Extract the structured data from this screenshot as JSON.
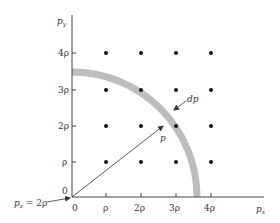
{
  "diagram": {
    "axes": {
      "x_label": "p",
      "x_label_sub": "x",
      "y_label": "p",
      "y_label_sub": "y",
      "origin_x_label": "0",
      "origin_y_label": "0",
      "x_ticks": [
        "ρ",
        "2ρ",
        "3ρ",
        "4ρ"
      ],
      "y_ticks": [
        "ρ",
        "2ρ",
        "3ρ",
        "4ρ"
      ]
    },
    "annotations": {
      "pz_label": "p",
      "pz_sub": "z",
      "pz_value": " = 2ρ",
      "radius_label": "p",
      "shell_label": "dp"
    },
    "grid": {
      "rows": 4,
      "cols": 4,
      "dot_color": "#111111"
    },
    "shell": {
      "color": "#bdbdbd",
      "radius_in_rho": 3.6
    },
    "colors": {
      "axis": "#444444",
      "arrow": "#333333"
    }
  }
}
